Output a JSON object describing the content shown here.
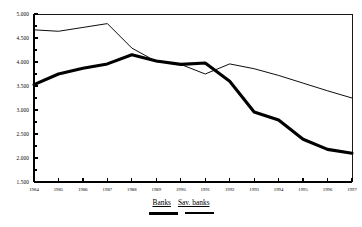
{
  "chart_data": {
    "type": "line",
    "title": "",
    "subtitle": "",
    "xlabel": "",
    "ylabel": "",
    "grid": false,
    "legend_position": "bottom-center",
    "categories": [
      "1984",
      "1985",
      "1986",
      "1987",
      "1988",
      "1989",
      "1990",
      "1991",
      "1992",
      "1993",
      "1994",
      "1995",
      "1996",
      "1997"
    ],
    "x": [
      1984,
      1985,
      1986,
      1987,
      1988,
      1989,
      1990,
      1991,
      1992,
      1993,
      1994,
      1995,
      1996,
      1997
    ],
    "ylim": [
      1500,
      5000
    ],
    "xlim": [
      1984,
      1997
    ],
    "yticks": [
      1500,
      2000,
      2500,
      3000,
      3500,
      4000,
      4500,
      5000
    ],
    "ytick_labels": [
      "1.500",
      "2.000",
      "2.500",
      "3.000",
      "3.500",
      "4.000",
      "4.500",
      "5.000"
    ],
    "series": [
      {
        "name": "Banks",
        "style": "thick",
        "values": [
          3530,
          3750,
          3870,
          3960,
          4150,
          4020,
          3950,
          3980,
          3600,
          2960,
          2790,
          2390,
          2180,
          2100
        ]
      },
      {
        "name": "Sav. banks",
        "style": "thin",
        "values": [
          4670,
          4640,
          4720,
          4800,
          4290,
          4010,
          3950,
          3750,
          3960,
          3860,
          3720,
          3560,
          3400,
          3250
        ]
      }
    ]
  },
  "legend": {
    "items": [
      {
        "label": "Banks",
        "swatch": "thick-line-swatch"
      },
      {
        "label": "Sav. banks",
        "swatch": "thin-line-swatch"
      }
    ]
  }
}
